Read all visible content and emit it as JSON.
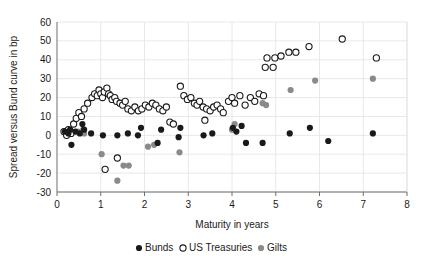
{
  "chart_data": {
    "type": "scatter",
    "title": "",
    "xlabel": "Maturity in years",
    "ylabel": "Spread versus Bund curve in bp",
    "xlim": [
      0,
      8
    ],
    "ylim": [
      -30,
      60
    ],
    "xticks": [
      0,
      1,
      2,
      3,
      4,
      5,
      6,
      7,
      8
    ],
    "yticks": [
      -30,
      -20,
      -10,
      0,
      10,
      20,
      30,
      40,
      50,
      60
    ],
    "grid": true,
    "legend_position": "bottom-center",
    "series": [
      {
        "name": "Bunds",
        "marker": "filled-circle",
        "color": "#1a1a1a",
        "points": [
          [
            0.18,
            2
          ],
          [
            0.26,
            1
          ],
          [
            0.3,
            3
          ],
          [
            0.33,
            -5
          ],
          [
            0.42,
            2
          ],
          [
            0.52,
            1
          ],
          [
            0.58,
            6
          ],
          [
            0.62,
            3
          ],
          [
            0.78,
            1
          ],
          [
            1.05,
            0
          ],
          [
            1.38,
            0
          ],
          [
            1.62,
            1
          ],
          [
            1.85,
            0
          ],
          [
            1.92,
            4
          ],
          [
            2.3,
            -4
          ],
          [
            2.38,
            3
          ],
          [
            2.78,
            -1
          ],
          [
            2.82,
            4
          ],
          [
            3.35,
            0
          ],
          [
            3.55,
            1
          ],
          [
            4.02,
            4
          ],
          [
            4.1,
            2
          ],
          [
            4.22,
            5
          ],
          [
            4.32,
            -4
          ],
          [
            4.7,
            -4
          ],
          [
            5.32,
            1
          ],
          [
            5.78,
            4
          ],
          [
            6.2,
            -3
          ],
          [
            7.22,
            1
          ]
        ]
      },
      {
        "name": "US Treasuries",
        "marker": "open-circle",
        "color": "#1a1a1a",
        "points": [
          [
            0.16,
            2
          ],
          [
            0.22,
            0
          ],
          [
            0.26,
            3
          ],
          [
            0.32,
            1
          ],
          [
            0.38,
            6
          ],
          [
            0.44,
            9
          ],
          [
            0.5,
            12
          ],
          [
            0.56,
            10
          ],
          [
            0.62,
            14
          ],
          [
            0.7,
            17
          ],
          [
            0.8,
            20
          ],
          [
            0.86,
            22
          ],
          [
            0.92,
            21
          ],
          [
            0.96,
            24
          ],
          [
            1.0,
            22
          ],
          [
            1.04,
            20
          ],
          [
            1.08,
            23
          ],
          [
            1.1,
            -18
          ],
          [
            1.14,
            25
          ],
          [
            1.18,
            22
          ],
          [
            1.22,
            21
          ],
          [
            1.26,
            19
          ],
          [
            1.32,
            20
          ],
          [
            1.36,
            18
          ],
          [
            1.38,
            -12
          ],
          [
            1.44,
            17
          ],
          [
            1.5,
            16
          ],
          [
            1.56,
            18
          ],
          [
            1.62,
            14
          ],
          [
            1.7,
            13
          ],
          [
            1.78,
            15
          ],
          [
            1.86,
            13
          ],
          [
            1.94,
            14
          ],
          [
            2.02,
            16
          ],
          [
            2.1,
            15
          ],
          [
            2.18,
            17
          ],
          [
            2.26,
            16
          ],
          [
            2.34,
            14
          ],
          [
            2.42,
            13
          ],
          [
            2.5,
            15
          ],
          [
            2.58,
            7
          ],
          [
            2.66,
            6
          ],
          [
            2.82,
            26
          ],
          [
            2.9,
            21
          ],
          [
            2.98,
            19
          ],
          [
            3.06,
            20
          ],
          [
            3.14,
            17
          ],
          [
            3.2,
            16
          ],
          [
            3.26,
            18
          ],
          [
            3.34,
            15
          ],
          [
            3.38,
            8
          ],
          [
            3.42,
            14
          ],
          [
            3.5,
            13
          ],
          [
            3.58,
            15
          ],
          [
            3.66,
            16
          ],
          [
            3.74,
            14
          ],
          [
            3.8,
            12
          ],
          [
            3.92,
            18
          ],
          [
            4.0,
            20
          ],
          [
            4.06,
            17
          ],
          [
            4.18,
            21
          ],
          [
            4.3,
            16
          ],
          [
            4.42,
            20
          ],
          [
            4.52,
            18
          ],
          [
            4.62,
            22
          ],
          [
            4.72,
            21
          ],
          [
            4.76,
            36
          ],
          [
            4.8,
            41
          ],
          [
            4.94,
            36
          ],
          [
            4.98,
            41
          ],
          [
            5.12,
            42
          ],
          [
            5.3,
            44
          ],
          [
            5.46,
            44
          ],
          [
            5.76,
            47
          ],
          [
            6.52,
            51
          ],
          [
            7.3,
            41
          ]
        ]
      },
      {
        "name": "Gilts",
        "marker": "filled-circle-gray",
        "color": "#8a8a8a",
        "points": [
          [
            0.48,
            2
          ],
          [
            0.6,
            3
          ],
          [
            0.62,
            1
          ],
          [
            1.02,
            -10
          ],
          [
            1.38,
            -24
          ],
          [
            1.52,
            -16
          ],
          [
            1.64,
            -16
          ],
          [
            2.08,
            -6
          ],
          [
            2.22,
            -5
          ],
          [
            2.8,
            -9
          ],
          [
            4.0,
            3
          ],
          [
            4.06,
            6
          ],
          [
            4.7,
            17
          ],
          [
            4.78,
            16
          ],
          [
            5.34,
            24
          ],
          [
            5.9,
            29
          ],
          [
            7.22,
            30
          ]
        ]
      }
    ]
  },
  "legend": {
    "items": [
      {
        "label": "Bunds",
        "marker": "filled-circle"
      },
      {
        "label": "US Treasuries",
        "marker": "open-circle"
      },
      {
        "label": "Gilts",
        "marker": "filled-circle-gray"
      }
    ]
  },
  "colors": {
    "bunds": "#1a1a1a",
    "us_treasuries": "#ffffff",
    "gilts": "#8a8a8a",
    "grid": "#e2e2e2",
    "axis": "#6e6e6e",
    "background": "#ffffff"
  }
}
